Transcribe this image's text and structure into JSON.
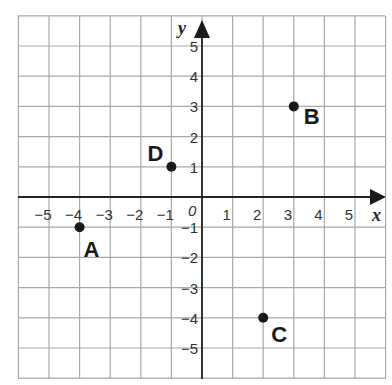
{
  "chart_data": {
    "type": "scatter",
    "title": "",
    "xlabel": "x",
    "ylabel": "y",
    "origin_label": "0",
    "xlim": [
      -6,
      6
    ],
    "ylim": [
      -6,
      6
    ],
    "grid": true,
    "x_ticks": [
      -5,
      -4,
      -3,
      -2,
      -1,
      1,
      2,
      3,
      4,
      5
    ],
    "y_ticks": [
      5,
      4,
      3,
      2,
      1,
      -1,
      -2,
      -3,
      -4,
      -5
    ],
    "x_tick_labels": [
      "−5",
      "−4",
      "−3",
      "−2",
      "−1",
      "1",
      "2",
      "3",
      "4",
      "5"
    ],
    "y_tick_labels": [
      "5",
      "4",
      "3",
      "2",
      "1",
      "−1",
      "−2",
      "−3",
      "−4",
      "−5"
    ],
    "points": [
      {
        "label": "A",
        "x": -4,
        "y": -1
      },
      {
        "label": "B",
        "x": 3,
        "y": 3
      },
      {
        "label": "C",
        "x": 2,
        "y": -4
      },
      {
        "label": "D",
        "x": -1,
        "y": 1
      }
    ],
    "legend": null
  },
  "colors": {
    "grid": "#a9a9a9",
    "axis": "#222222",
    "point": "#1a1a1a",
    "background": "#ffffff"
  }
}
